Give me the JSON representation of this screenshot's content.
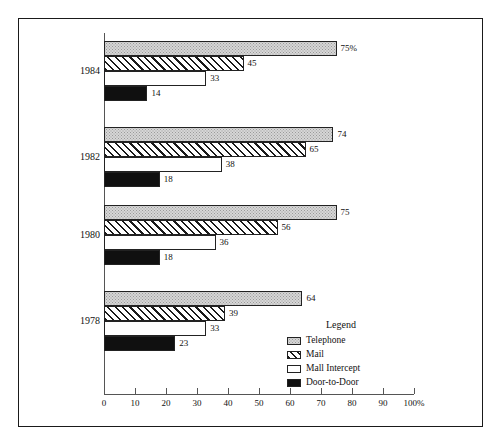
{
  "chart_data": {
    "type": "bar",
    "orientation": "horizontal",
    "title": "",
    "xlabel": "",
    "ylabel": "",
    "xlim": [
      0,
      100
    ],
    "xticks": [
      0,
      10,
      20,
      30,
      40,
      50,
      60,
      70,
      80,
      90,
      100
    ],
    "xtick_labels": [
      "0",
      "10",
      "20",
      "30",
      "40",
      "50",
      "60",
      "70",
      "80",
      "90",
      "100%"
    ],
    "grid": false,
    "categories": [
      "1984",
      "1982",
      "1980",
      "1978"
    ],
    "legend_title": "Legend",
    "legend_position": "inside-lower-right",
    "series": [
      {
        "name": "Telephone",
        "pattern": "light-gray-stipple",
        "color": "#d6d6d6",
        "values": [
          75,
          74,
          75,
          64
        ],
        "value_labels": [
          "75%",
          "74",
          "75",
          "64"
        ]
      },
      {
        "name": "Mail",
        "pattern": "diagonal-hatch",
        "color": "#ffffff",
        "values": [
          45,
          65,
          56,
          39
        ],
        "value_labels": [
          "45",
          "65",
          "56",
          "39"
        ]
      },
      {
        "name": "Mall Intercept",
        "pattern": "white-solid",
        "color": "#ffffff",
        "values": [
          33,
          38,
          36,
          33
        ],
        "value_labels": [
          "33",
          "38",
          "36",
          "33"
        ]
      },
      {
        "name": "Door-to-Door",
        "pattern": "black-solid",
        "color": "#101010",
        "values": [
          14,
          18,
          18,
          23
        ],
        "value_labels": [
          "14",
          "18",
          "18",
          "23"
        ]
      }
    ]
  },
  "groups": [
    {
      "label": "1984",
      "bars": [
        {
          "series": "Telephone",
          "value": 75,
          "label": "75%"
        },
        {
          "series": "Mail",
          "value": 45,
          "label": "45"
        },
        {
          "series": "Mall Intercept",
          "value": 33,
          "label": "33"
        },
        {
          "series": "Door-to-Door",
          "value": 14,
          "label": "14"
        }
      ]
    },
    {
      "label": "1982",
      "bars": [
        {
          "series": "Telephone",
          "value": 74,
          "label": "74"
        },
        {
          "series": "Mail",
          "value": 65,
          "label": "65"
        },
        {
          "series": "Mall Intercept",
          "value": 38,
          "label": "38"
        },
        {
          "series": "Door-to-Door",
          "value": 18,
          "label": "18"
        }
      ]
    },
    {
      "label": "1980",
      "bars": [
        {
          "series": "Telephone",
          "value": 75,
          "label": "75"
        },
        {
          "series": "Mail",
          "value": 56,
          "label": "56"
        },
        {
          "series": "Mall Intercept",
          "value": 36,
          "label": "36"
        },
        {
          "series": "Door-to-Door",
          "value": 18,
          "label": "18"
        }
      ]
    },
    {
      "label": "1978",
      "bars": [
        {
          "series": "Telephone",
          "value": 64,
          "label": "64"
        },
        {
          "series": "Mail",
          "value": 39,
          "label": "39"
        },
        {
          "series": "Mall Intercept",
          "value": 33,
          "label": "33"
        },
        {
          "series": "Door-to-Door",
          "value": 23,
          "label": "23"
        }
      ]
    }
  ],
  "axis": {
    "ticks": [
      "0",
      "10",
      "20",
      "30",
      "40",
      "50",
      "60",
      "70",
      "80",
      "90",
      "100%"
    ]
  },
  "legend": {
    "title": "Legend",
    "items": [
      {
        "label": "Telephone",
        "pattern": "telephone"
      },
      {
        "label": "Mail",
        "pattern": "mail"
      },
      {
        "label": "Mall Intercept",
        "pattern": "mall"
      },
      {
        "label": "Door-to-Door",
        "pattern": "door"
      }
    ]
  }
}
